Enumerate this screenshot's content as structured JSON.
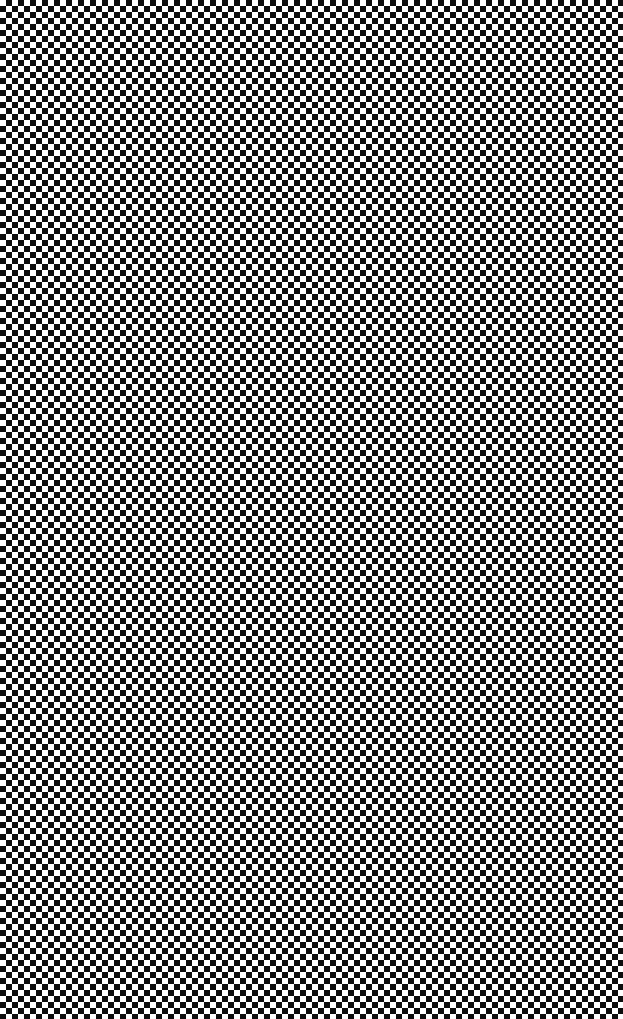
{
  "page": {
    "kind": "full-bleed-texture",
    "width_px": 623,
    "height_px": 1019,
    "has_ui_chrome": false,
    "has_text": false,
    "has_icons": false
  },
  "pattern": {
    "name": "diamond-checkerboard",
    "geometry": "rotated-square-lattice",
    "rotation_deg": 45,
    "cell_period_x_px": 12,
    "cell_period_y_px": 12,
    "tile_size_px": 12,
    "half_tile_px": 6,
    "offset_x_px": 6,
    "offset_y_px": 6,
    "diamonds_across": 52,
    "diamonds_down": 85,
    "edges_clipped": true,
    "uniform_across_canvas": true
  },
  "colors": {
    "dark": "#0d0d0d",
    "light": "#ffffff",
    "background": "#ffffff"
  }
}
